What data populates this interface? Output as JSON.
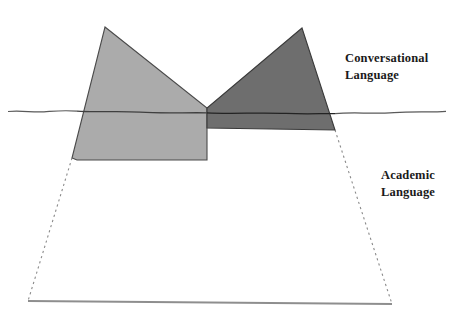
{
  "diagram": {
    "kind": "iceberg-diagram",
    "background_color": "#ffffff",
    "labels": {
      "conversational": "Conversational\nLanguage",
      "academic": "Academic\nLanguage"
    },
    "colors": {
      "light_ice": "#ababab",
      "dark_ice": "#6e6e6e",
      "outline": "#3a3a3a",
      "waterline": "#4a4a4a",
      "dashed_outline": "#8a8a8a",
      "base_line": "#8a8a8a",
      "text": "#1a1a1a"
    },
    "shapes": {
      "left_ice": {
        "name": "light-gray-iceberg-peak",
        "fill": "#ababab",
        "points": "105,27 207,108 207,160 77,160 72,158"
      },
      "right_ice": {
        "name": "dark-gray-iceberg-peak",
        "fill": "#6e6e6e",
        "points": "302,28 207,108 207,128 335,130"
      },
      "submerged": {
        "name": "submerged-iceberg-outline",
        "points": "72,158 28,301 392,304 335,130",
        "style": "dashed"
      }
    },
    "waterline": {
      "name": "waterline",
      "y": 111,
      "x_start": 8,
      "x_end": 446,
      "style": "wavy"
    },
    "base_line": {
      "name": "iceberg-base-line",
      "x_start": 28,
      "x_end": 392,
      "y_start": 301,
      "y_end": 304
    }
  }
}
